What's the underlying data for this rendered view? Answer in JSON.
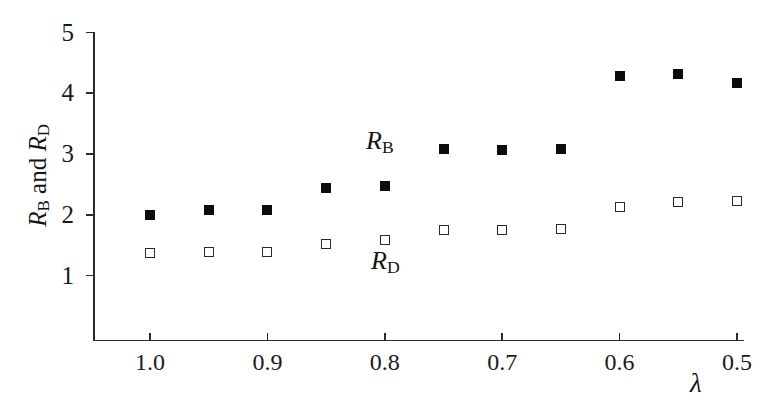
{
  "chart_data": {
    "type": "scatter",
    "title": "",
    "xlabel": "λ",
    "ylabel": "R_B and R_D",
    "xlim": [
      1.025,
      0.485
    ],
    "ylim": [
      0.45,
      5.15
    ],
    "x_reversed": true,
    "grid": false,
    "legend_position": "in-plot annotations",
    "x": [
      1.0,
      0.95,
      0.9,
      0.85,
      0.8,
      0.75,
      0.7,
      0.65,
      0.6,
      0.55,
      0.5
    ],
    "x_tick_labels": [
      "1.0",
      "0.9",
      "0.8",
      "0.7",
      "0.6",
      "0.5"
    ],
    "x_tick_values": [
      1.0,
      0.9,
      0.8,
      0.7,
      0.6,
      0.5
    ],
    "y_tick_labels": [
      "5",
      "4",
      "3",
      "2",
      "1"
    ],
    "y_tick_values": [
      5,
      4,
      3,
      2,
      1
    ],
    "series": [
      {
        "name": "R_B",
        "marker": "filled-square",
        "color": "#0d0d0d",
        "values": [
          1.99,
          2.07,
          2.08,
          2.44,
          2.47,
          3.08,
          3.06,
          3.08,
          4.29,
          4.32,
          4.17
        ]
      },
      {
        "name": "R_D",
        "marker": "open-square",
        "color": "#2a2a2a",
        "values": [
          1.37,
          1.39,
          1.38,
          1.52,
          1.58,
          1.75,
          1.75,
          1.76,
          2.13,
          2.21,
          2.23
        ]
      }
    ],
    "annotations": [
      {
        "text": "R_B",
        "x": 0.805,
        "y": 3.35
      },
      {
        "text": "R_D",
        "x": 0.8,
        "y": 1.27
      }
    ]
  },
  "axis": {
    "y_title_main": "R",
    "y_title_sub_b": "B",
    "y_title_and": " and ",
    "y_title_sub_d": "D",
    "x_title": "λ"
  },
  "labels": {
    "rb_main": "R",
    "rb_sub": "B",
    "rd_main": "R",
    "rd_sub": "D"
  }
}
